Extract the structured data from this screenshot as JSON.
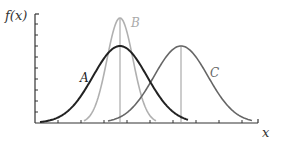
{
  "chart_data": {
    "type": "line",
    "title": "",
    "xlabel": "x",
    "ylabel": "f(x)",
    "grid": false,
    "legend": "inline labels",
    "x_ticks_count": 10,
    "y_ticks_count": 9,
    "note": "Peak positions, widths, and tick spacing are estimated from 3x nearest-neighbor zooms of a 281x146 image; the chart has no labeled tick values, so 'relative' units are derived from pixel readings. Curve A shows no vertical center line; B's marker is assumed to share A's center.",
    "series": [
      {
        "name": "A",
        "description": "wide normal curve, lower peak",
        "mean_px": 120,
        "peak_y_px": 46,
        "sigma_px": 27,
        "color": "#222222",
        "mean_relative": 0.38,
        "peak_relative": 0.7,
        "centerline": false
      },
      {
        "name": "B",
        "description": "narrow normal curve, same mean as A, taller peak",
        "mean_px": 120,
        "peak_y_px": 18,
        "sigma_px": 13,
        "color": "#b0b0b0",
        "mean_relative": 0.38,
        "peak_relative": 0.96,
        "centerline": true
      },
      {
        "name": "C",
        "description": "wide normal curve, same spread as A, shifted right",
        "mean_px": 181,
        "peak_y_px": 46,
        "sigma_px": 27,
        "color": "#666666",
        "mean_relative": 0.65,
        "peak_relative": 0.7,
        "centerline": true
      }
    ]
  },
  "labels": {
    "y_axis": "f(x)",
    "x_axis": "x",
    "curve_a": "A",
    "curve_b": "B",
    "curve_c": "C"
  },
  "layout": {
    "origin_x": 35,
    "baseline_y": 123,
    "axis_top_y": 14,
    "axis_right_x": 258,
    "x_tick_step": 23,
    "y_tick_step": 11,
    "colors": {
      "axis": "#333333",
      "curve_a": "#222222",
      "curve_b": "#b0b0b0",
      "curve_c": "#666666",
      "centerline": "#999999"
    }
  }
}
